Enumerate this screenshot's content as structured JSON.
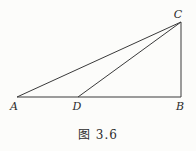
{
  "figure": {
    "caption": "图 3.6",
    "line_color": "#3a3a3a",
    "line_width": 1,
    "background": "#fcfcfa",
    "vertices": {
      "A": {
        "label": "A",
        "x": 17,
        "y": 97,
        "label_x": 14,
        "label_y": 110
      },
      "D": {
        "label": "D",
        "x": 78,
        "y": 97,
        "label_x": 77,
        "label_y": 110
      },
      "B": {
        "label": "B",
        "x": 181,
        "y": 97,
        "label_x": 180,
        "label_y": 110
      },
      "C": {
        "label": "C",
        "x": 181,
        "y": 22,
        "label_x": 178,
        "label_y": 18
      }
    },
    "segments": [
      {
        "from": "A",
        "to": "B"
      },
      {
        "from": "A",
        "to": "C"
      },
      {
        "from": "D",
        "to": "C"
      },
      {
        "from": "B",
        "to": "C"
      }
    ]
  }
}
